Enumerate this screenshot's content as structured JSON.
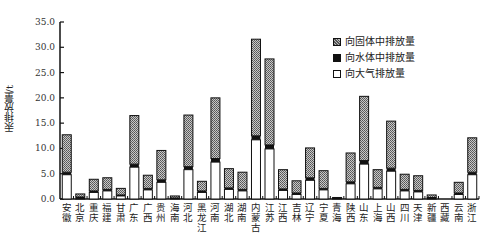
{
  "chart_data": {
    "type": "bar",
    "stacked": true,
    "title": "",
    "xlabel": "",
    "ylabel": "汞排放量/t",
    "ylim": [
      0,
      35
    ],
    "yticks": [
      "0.0",
      "5.0",
      "10.0",
      "15.0",
      "20.0",
      "25.0",
      "30.0",
      "35.0"
    ],
    "grid": false,
    "legend_position": "upper right",
    "categories": [
      "安徽",
      "北京",
      "重庆",
      "福建",
      "甘肃",
      "广东",
      "广西",
      "贵州",
      "海南",
      "河北",
      "黑龙江",
      "河南",
      "湖北",
      "湖南",
      "内蒙古",
      "江苏",
      "江西",
      "吉林",
      "辽宁",
      "宁夏",
      "青海",
      "陕西",
      "山东",
      "上海",
      "山西",
      "四川",
      "天津",
      "新疆",
      "西藏",
      "云南",
      "浙江"
    ],
    "series": [
      {
        "name": "向大气排放量",
        "values": [
          4.8,
          0.2,
          1.3,
          1.6,
          0.6,
          6.3,
          1.8,
          3.3,
          0.1,
          5.8,
          1.3,
          7.3,
          1.9,
          1.6,
          11.7,
          9.9,
          1.7,
          0.9,
          3.7,
          1.8,
          0.05,
          3.0,
          6.9,
          2.0,
          5.5,
          1.6,
          1.4,
          0.2,
          0.0,
          0.9,
          4.8
        ]
      },
      {
        "name": "向水体中排放量",
        "values": [
          0.5,
          0.2,
          0.3,
          0.3,
          0.2,
          0.6,
          0.3,
          0.5,
          0.1,
          0.6,
          0.3,
          0.7,
          0.3,
          0.3,
          0.8,
          0.8,
          0.3,
          0.3,
          0.5,
          0.3,
          0.05,
          0.4,
          0.7,
          0.3,
          0.6,
          0.3,
          0.3,
          0.1,
          0.0,
          0.3,
          0.5
        ]
      },
      {
        "name": "向固体中排放量",
        "values": [
          7.4,
          0.6,
          2.3,
          2.3,
          1.3,
          9.6,
          2.6,
          5.8,
          0.4,
          10.2,
          1.9,
          12.0,
          3.8,
          3.4,
          19.1,
          17.0,
          3.8,
          2.4,
          5.9,
          3.5,
          0.2,
          5.7,
          12.7,
          3.5,
          9.3,
          3.0,
          2.9,
          0.5,
          0.0,
          2.1,
          6.8
        ]
      }
    ]
  },
  "legend": {
    "items": [
      {
        "label": "向固体中排放量",
        "style": "hatched"
      },
      {
        "label": "向水体中排放量",
        "style": "solid-black"
      },
      {
        "label": "向大气排放量",
        "style": "white"
      }
    ]
  },
  "axis": {
    "ylabel": "汞排放量/t"
  }
}
